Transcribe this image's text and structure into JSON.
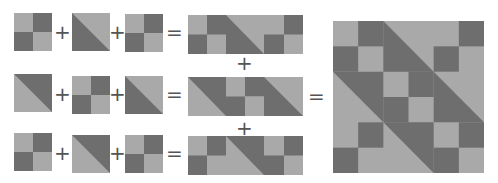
{
  "colors": {
    "light": "#a9a9a9",
    "dark": "#6e6e6e",
    "background": "#ffffff"
  },
  "operators": {
    "plus": "+",
    "equals": "="
  },
  "block_types": {
    "four_patch": "four-patch block (TL light, TR dark, BL dark, BR light)",
    "hst_dark_lower_left": "half-square triangle, dark lower-left",
    "hst_dark_upper_right": "half-square triangle, dark upper-right"
  },
  "rows": [
    {
      "blocks": [
        "four_patch",
        "hst_dark_lower_left",
        "four_patch"
      ]
    },
    {
      "blocks": [
        "hst_dark_upper_right",
        "four_patch",
        "hst_dark_lower_left"
      ]
    },
    {
      "blocks": [
        "four_patch",
        "hst_dark_upper_right",
        "four_patch"
      ]
    }
  ],
  "result": "3x3 quilt block assembled from the three rows"
}
